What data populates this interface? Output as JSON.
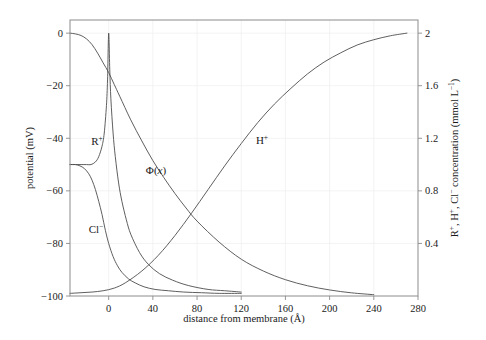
{
  "figure": {
    "name": "membrane-potential-concentration-plot",
    "background_color": "#ffffff",
    "curve_color": "#4d4d4d",
    "frame_color": "#8c8c8c",
    "grid_color": "#eeeeee"
  },
  "chart_data": {
    "type": "line",
    "title": "",
    "xlabel": "distance from membrane (Å)",
    "ylabel": "potential (mV)",
    "y2label": "R⁺, H⁺, Cl⁻ concentration (mmol L⁻¹)",
    "xlim": [
      -35,
      280
    ],
    "ylim": [
      -100,
      5
    ],
    "y2lim": [
      0,
      2.1
    ],
    "xticks": [
      0,
      40,
      80,
      120,
      160,
      200,
      240,
      280
    ],
    "xticklabels": [
      "0",
      "40",
      "80",
      "120",
      "160",
      "200",
      "240",
      "280"
    ],
    "yticks": [
      0,
      -20,
      -40,
      -60,
      -80,
      -100
    ],
    "yticklabels": [
      "0",
      "−20",
      "−40",
      "−60",
      "−80",
      "−100"
    ],
    "y2ticks": [
      0.4,
      0.8,
      1.2,
      1.6,
      2.0
    ],
    "y2ticklabels": [
      "0.4",
      "0.8",
      "1.2",
      "1.6",
      "2"
    ],
    "grid": true,
    "legend": "inline-annotations",
    "series": [
      {
        "name": "Phi(x)",
        "label": "Φ(x)",
        "axis": "left",
        "unit": "mV",
        "x": [
          -35,
          -30,
          -25,
          -20,
          -15,
          -10,
          -5,
          0,
          5,
          10,
          20,
          30,
          40,
          50,
          60,
          70,
          80,
          100,
          120,
          140,
          160,
          180,
          200,
          220,
          240
        ],
        "y": [
          0,
          -0.3,
          -0.9,
          -2.2,
          -4.4,
          -7.6,
          -11.3,
          -15.0,
          -19.5,
          -24.0,
          -33.0,
          -41.0,
          -48.5,
          -55.0,
          -61.0,
          -66.5,
          -71.5,
          -79.5,
          -86.0,
          -90.5,
          -93.8,
          -96.1,
          -97.7,
          -98.8,
          -99.5
        ]
      },
      {
        "name": "R-plus",
        "label": "R⁺",
        "axis": "right",
        "unit": "mmol L⁻¹",
        "x": [
          -35,
          -30,
          -25,
          -20,
          -16,
          -12,
          -9,
          -6,
          -4,
          -2,
          -1,
          0,
          1,
          2,
          4,
          6,
          9,
          12,
          16,
          20,
          28,
          36,
          46,
          58,
          72,
          90,
          105,
          120
        ],
        "y": [
          1.0,
          1.0,
          1.0,
          1.0,
          1.0,
          1.02,
          1.06,
          1.14,
          1.24,
          1.45,
          1.65,
          2.0,
          1.72,
          1.5,
          1.24,
          1.06,
          0.86,
          0.72,
          0.58,
          0.47,
          0.33,
          0.24,
          0.17,
          0.12,
          0.08,
          0.05,
          0.04,
          0.03
        ]
      },
      {
        "name": "Cl-minus",
        "label": "Cl⁻",
        "axis": "right",
        "unit": "mmol L⁻¹",
        "x": [
          -35,
          -30,
          -26,
          -22,
          -18,
          -15,
          -12,
          -9,
          -6,
          -3,
          0,
          4,
          8,
          12,
          18,
          24,
          32,
          42,
          54,
          68,
          84,
          100,
          120
        ],
        "y": [
          1.0,
          1.0,
          0.99,
          0.97,
          0.93,
          0.88,
          0.81,
          0.72,
          0.62,
          0.5,
          0.4,
          0.3,
          0.23,
          0.18,
          0.13,
          0.1,
          0.07,
          0.05,
          0.04,
          0.03,
          0.025,
          0.02,
          0.02
        ]
      },
      {
        "name": "H-plus",
        "label": "H⁺",
        "axis": "right",
        "unit": "mmol L⁻¹",
        "x": [
          -35,
          -25,
          -15,
          -5,
          5,
          15,
          30,
          45,
          60,
          75,
          90,
          105,
          120,
          135,
          150,
          165,
          180,
          195,
          210,
          225,
          240,
          255,
          270
        ],
        "y": [
          0.02,
          0.025,
          0.03,
          0.04,
          0.06,
          0.1,
          0.19,
          0.31,
          0.46,
          0.63,
          0.81,
          0.99,
          1.16,
          1.32,
          1.46,
          1.58,
          1.69,
          1.78,
          1.85,
          1.91,
          1.95,
          1.98,
          2.0
        ]
      }
    ],
    "annotations": [
      {
        "name": "label-R-plus",
        "text": "R",
        "sup": "+",
        "x_px": 97,
        "y_px": 145
      },
      {
        "name": "label-Phi",
        "text": "Φ(",
        "ital": "x",
        "close": ")",
        "x_px": 156,
        "y_px": 174
      },
      {
        "name": "label-Cl-minus",
        "text": "Cl",
        "sup": "−",
        "x_px": 96,
        "y_px": 233
      },
      {
        "name": "label-H-plus",
        "text": "H",
        "sup": "+",
        "x_px": 262,
        "y_px": 144
      }
    ]
  }
}
